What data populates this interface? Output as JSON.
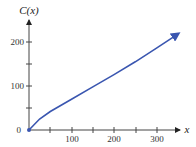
{
  "chart_data": {
    "type": "line",
    "title": "",
    "xlabel": "x",
    "ylabel": "C(x)",
    "xlim": [
      0,
      360
    ],
    "ylim": [
      0,
      245
    ],
    "x_ticks": [
      0,
      50,
      100,
      150,
      200,
      250,
      300
    ],
    "x_tick_labels": [
      "",
      "",
      "100",
      "",
      "200",
      "",
      "300"
    ],
    "y_ticks": [
      0,
      50,
      100,
      150,
      200
    ],
    "y_tick_labels": [
      "0",
      "",
      "100",
      "",
      "200"
    ],
    "grid": false,
    "legend": null,
    "series": [
      {
        "name": "C(x)",
        "color": "#3a56b0",
        "x": [
          0,
          25,
          50,
          100,
          150,
          200,
          250,
          300,
          350
        ],
        "y": [
          0,
          25,
          42,
          70,
          98,
          126,
          155,
          186,
          218
        ]
      }
    ]
  },
  "labels": {
    "y_axis": "C(x)",
    "x_axis": "x",
    "origin": "0",
    "x100": "100",
    "x200": "200",
    "x300": "300",
    "y100": "100",
    "y200": "200"
  }
}
